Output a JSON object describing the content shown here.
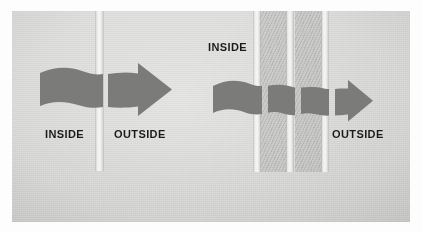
{
  "figure": {
    "type": "technical-illustration",
    "medium": "scanned-photograph",
    "caption_visible": false,
    "background_color": "#ffffff",
    "photo_color": "#cbcbc9",
    "arrow_color": "#7b7b79",
    "barrier_color": "#f2f2f0",
    "text_color": "#1b1b1b"
  },
  "diagrams": [
    {
      "id": "single-barrier",
      "name": "single-layer-barrier",
      "barrier_count": 1,
      "arrow_segments": 2,
      "labels": {
        "inside": "INSIDE",
        "outside": "OUTSIDE"
      }
    },
    {
      "id": "multi-barrier",
      "name": "multi-layer-barrier",
      "barrier_count": 3,
      "arrow_segments": 4,
      "labels": {
        "inside": "INSIDE",
        "outside": "OUTSIDE"
      }
    }
  ]
}
